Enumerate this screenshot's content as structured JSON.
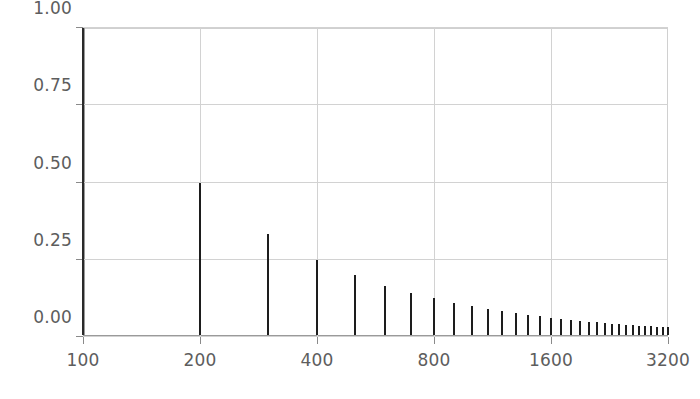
{
  "figure": {
    "title": "",
    "background": "#ffffff",
    "bar_color": "#1d1d1d",
    "grid_color": "#d2d2d2",
    "axis_color": "#9a9a9a",
    "label_color": "#5d5d5d"
  },
  "axes": {
    "y": {
      "label": "",
      "ticks": [
        {
          "value": 1.0,
          "label": "1.00"
        },
        {
          "value": 0.75,
          "label": "0.75"
        },
        {
          "value": 0.5,
          "label": "0.50"
        },
        {
          "value": 0.25,
          "label": "0.25"
        },
        {
          "value": 0.0,
          "label": "0.00"
        }
      ],
      "min": 0.0,
      "max": 1.0
    },
    "x": {
      "label": "",
      "scale": "log2",
      "ticks": [
        {
          "value": 100,
          "label": "100"
        },
        {
          "value": 200,
          "label": "200"
        },
        {
          "value": 400,
          "label": "400"
        },
        {
          "value": 800,
          "label": "800"
        },
        {
          "value": 1600,
          "label": "1600"
        },
        {
          "value": 3200,
          "label": "3200"
        }
      ],
      "min": 100,
      "max": 3200
    }
  },
  "chart_data": {
    "type": "bar",
    "title": "",
    "xlabel": "",
    "ylabel": "",
    "xscale": "log2",
    "yscale": "linear",
    "xlim": [
      100,
      3200
    ],
    "ylim": [
      0.0,
      1.0
    ],
    "grid": true,
    "legend": null,
    "series_name": "harmonic amplitude",
    "x": [
      100,
      200,
      300,
      400,
      500,
      600,
      700,
      800,
      900,
      1000,
      1100,
      1200,
      1300,
      1400,
      1500,
      1600,
      1700,
      1800,
      1900,
      2000,
      2100,
      2200,
      2300,
      2400,
      2500,
      2600,
      2700,
      2800,
      2900,
      3000,
      3100,
      3200
    ],
    "values": [
      1.0,
      0.5,
      0.3333,
      0.25,
      0.2,
      0.1667,
      0.1429,
      0.125,
      0.1111,
      0.1,
      0.0909,
      0.0833,
      0.0769,
      0.0714,
      0.0667,
      0.0625,
      0.0588,
      0.0556,
      0.0526,
      0.05,
      0.0476,
      0.0455,
      0.0435,
      0.0417,
      0.04,
      0.0385,
      0.037,
      0.0357,
      0.0345,
      0.0333,
      0.0323,
      0.03125
    ],
    "harmonic_numbers": [
      1,
      2,
      3,
      4,
      5,
      6,
      7,
      8,
      9,
      10,
      11,
      12,
      13,
      14,
      15,
      16,
      17,
      18,
      19,
      20,
      21,
      22,
      23,
      24,
      25,
      26,
      27,
      28,
      29,
      30,
      31,
      32
    ]
  }
}
